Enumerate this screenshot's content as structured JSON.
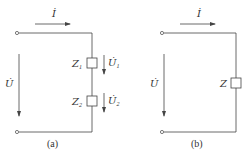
{
  "colors": {
    "stroke": "#444444",
    "text": "#333333",
    "background": "#ffffff"
  },
  "circuit_a": {
    "caption": "(a)",
    "current_label": "İ",
    "voltage_label": "U̇",
    "impedances": [
      {
        "name": "Z",
        "subscript": "1",
        "voltage_name": "U̇",
        "voltage_subscript": "1"
      },
      {
        "name": "Z",
        "subscript": "2",
        "voltage_name": "U̇",
        "voltage_subscript": "2"
      }
    ]
  },
  "circuit_b": {
    "caption": "(b)",
    "current_label": "İ",
    "voltage_label": "U̇",
    "impedance": {
      "name": "Z"
    }
  }
}
